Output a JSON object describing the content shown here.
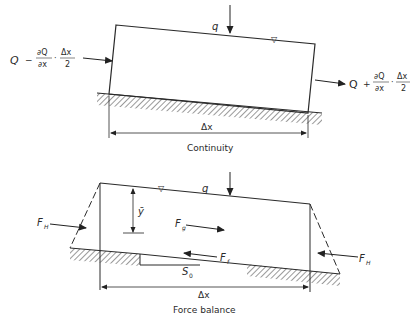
{
  "continuity": {
    "caption": "Continuity",
    "inflow_label": {
      "Q": "Q",
      "op": "−",
      "num1": "∂Q",
      "den1": "∂x",
      "dot": "·",
      "num2": "Δx",
      "den2": "2"
    },
    "outflow_label": {
      "Q": "Q",
      "op": "+",
      "num1": "∂Q",
      "den1": "∂x",
      "dot": "·",
      "num2": "Δx",
      "den2": "2"
    },
    "lateral_inflow": "q",
    "water_surface_symbol": "▽",
    "length_label": "Δx"
  },
  "force_balance": {
    "caption": "Force balance",
    "hydrostatic_left": {
      "F": "F",
      "sub": "H"
    },
    "hydrostatic_right": {
      "F": "F",
      "sub": "H"
    },
    "gravity": {
      "F": "F",
      "sub": "g"
    },
    "friction": {
      "F": "F",
      "sub": "f"
    },
    "centroid_depth": "ȳ",
    "bed_slope": {
      "S": "S",
      "sub": "0"
    },
    "lateral_inflow": "q",
    "water_surface_symbol": "▽",
    "length_label": "Δx"
  },
  "colors": {
    "line": "#2a2a2a",
    "hatch": "#555555",
    "background": "#ffffff"
  }
}
